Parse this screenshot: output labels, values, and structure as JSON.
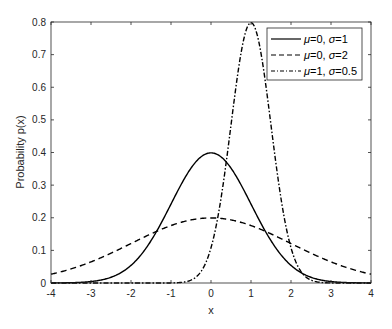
{
  "chart_data": {
    "type": "line",
    "title": "",
    "xlabel": "x",
    "ylabel": "Probability p(x)",
    "xlim": [
      -4,
      4
    ],
    "ylim": [
      0,
      0.8
    ],
    "xticks": [
      -4,
      -3,
      -2,
      -1,
      0,
      1,
      2,
      3,
      4
    ],
    "yticks": [
      0,
      0.1,
      0.2,
      0.3,
      0.4,
      0.5,
      0.6,
      0.7,
      0.8
    ],
    "xtick_labels": [
      "-4",
      "-3",
      "-2",
      "-1",
      "0",
      "1",
      "2",
      "3",
      "4"
    ],
    "ytick_labels": [
      "0",
      "0.1",
      "0.2",
      "0.3",
      "0.4",
      "0.5",
      "0.6",
      "0.7",
      "0.8"
    ],
    "grid": false,
    "legend_position": "upper right",
    "series": [
      {
        "name": "μ=0, σ=1",
        "mu": 0,
        "sigma": 1,
        "style": "solid",
        "x": [
          -4,
          -3,
          -2,
          -1,
          0,
          1,
          2,
          3,
          4
        ],
        "values": [
          0.0001,
          0.0044,
          0.054,
          0.242,
          0.399,
          0.242,
          0.054,
          0.0044,
          0.0001
        ]
      },
      {
        "name": "μ=0, σ=2",
        "mu": 0,
        "sigma": 2,
        "style": "dashed",
        "x": [
          -4,
          -3,
          -2,
          -1,
          0,
          1,
          2,
          3,
          4
        ],
        "values": [
          0.027,
          0.065,
          0.121,
          0.176,
          0.199,
          0.176,
          0.121,
          0.065,
          0.027
        ]
      },
      {
        "name": "μ=1, σ=0.5",
        "mu": 1,
        "sigma": 0.5,
        "style": "dashdot",
        "x": [
          -4,
          -3,
          -2,
          -1,
          0,
          1,
          2,
          3,
          4
        ],
        "values": [
          0.0,
          0.0,
          0.0,
          0.0003,
          0.108,
          0.798,
          0.108,
          0.0003,
          0.0
        ]
      }
    ]
  },
  "legend": {
    "items": [
      {
        "mu_sym": "μ",
        "mu_val": "=0, ",
        "sigma_sym": "σ",
        "sigma_val": "=1"
      },
      {
        "mu_sym": "μ",
        "mu_val": "=0, ",
        "sigma_sym": "σ",
        "sigma_val": "=2"
      },
      {
        "mu_sym": "μ",
        "mu_val": "=1, ",
        "sigma_sym": "σ",
        "sigma_val": "=0.5"
      }
    ]
  }
}
